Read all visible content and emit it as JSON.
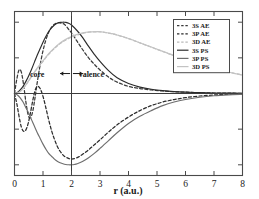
{
  "chart_data": {
    "type": "line",
    "title": "",
    "subtitle": "",
    "xlabel": "r (a.u.)",
    "ylabel": "",
    "xlim": [
      0,
      8
    ],
    "ylim": [
      -1.15,
      1.15
    ],
    "xticks": [
      0,
      1,
      2,
      3,
      4,
      5,
      6,
      7,
      8
    ],
    "xticklabels": [
      "0",
      "1",
      "2",
      "3",
      "4",
      "5",
      "6",
      "7",
      "8"
    ],
    "yticks": [
      -1.0,
      -0.5,
      0.0,
      0.5,
      1.0
    ],
    "yticklabels": [
      "",
      "",
      "",
      "",
      ""
    ],
    "grid": false,
    "legend_position": "upper right",
    "zero_line": 0,
    "annotations": [
      {
        "name": "cutoff-line",
        "type": "vline",
        "x": 2.0,
        "label": ""
      },
      {
        "name": "core-label",
        "type": "text",
        "text": "core",
        "x": 1.05,
        "y": 0.28
      },
      {
        "name": "valence-label",
        "type": "text",
        "text": "valence",
        "x": 2.25,
        "y": 0.28
      },
      {
        "name": "core-arrow",
        "type": "arrow",
        "from_x": 1.95,
        "to_x": 1.6,
        "y": 0.28
      },
      {
        "name": "valence-arrow",
        "type": "arrow",
        "from_x": 2.05,
        "to_x": 2.4,
        "y": 0.28
      }
    ],
    "series": [
      {
        "name": "3S AE",
        "style": "dashed",
        "color": "#3a3a3a",
        "x": [
          0.0,
          0.08,
          0.16,
          0.24,
          0.32,
          0.4,
          0.48,
          0.56,
          0.64,
          0.72,
          0.8,
          0.9,
          1.0,
          1.1,
          1.2,
          1.3,
          1.4,
          1.5,
          1.6,
          1.75,
          1.9,
          2.0,
          2.2,
          2.4,
          2.6,
          2.8,
          3.0,
          3.3,
          3.6,
          4.0,
          4.4,
          4.8,
          5.2,
          5.6,
          6.0,
          6.5,
          7.0,
          7.5,
          8.0
        ],
        "y": [
          0.0,
          0.2,
          0.33,
          0.3,
          0.12,
          -0.12,
          -0.3,
          -0.34,
          -0.25,
          -0.06,
          0.16,
          0.4,
          0.6,
          0.75,
          0.86,
          0.93,
          0.97,
          0.99,
          0.99,
          0.97,
          0.9,
          0.85,
          0.73,
          0.61,
          0.5,
          0.41,
          0.33,
          0.23,
          0.16,
          0.1,
          0.07,
          0.05,
          0.035,
          0.025,
          0.018,
          0.011,
          0.007,
          0.004,
          0.003
        ]
      },
      {
        "name": "3P AE",
        "style": "dashed",
        "color": "#2b2b2b",
        "x": [
          0.0,
          0.08,
          0.16,
          0.24,
          0.32,
          0.4,
          0.48,
          0.56,
          0.64,
          0.72,
          0.8,
          0.9,
          1.0,
          1.1,
          1.2,
          1.3,
          1.4,
          1.5,
          1.6,
          1.75,
          1.9,
          2.0,
          2.2,
          2.4,
          2.6,
          2.8,
          3.0,
          3.3,
          3.6,
          4.0,
          4.4,
          4.8,
          5.2,
          5.6,
          6.0,
          6.5,
          7.0,
          7.5,
          8.0
        ],
        "y": [
          0.0,
          -0.14,
          -0.32,
          -0.47,
          -0.53,
          -0.51,
          -0.42,
          -0.27,
          -0.1,
          0.04,
          0.1,
          0.07,
          -0.04,
          -0.2,
          -0.37,
          -0.52,
          -0.64,
          -0.74,
          -0.81,
          -0.88,
          -0.91,
          -0.92,
          -0.9,
          -0.85,
          -0.79,
          -0.72,
          -0.65,
          -0.54,
          -0.44,
          -0.33,
          -0.24,
          -0.17,
          -0.12,
          -0.085,
          -0.058,
          -0.035,
          -0.021,
          -0.012,
          -0.008
        ]
      },
      {
        "name": "3D AE",
        "style": "dashed",
        "color": "#b9b9b9",
        "x": [
          0.0,
          0.1,
          0.2,
          0.3,
          0.4,
          0.5,
          0.6,
          0.7,
          0.8,
          0.9,
          1.0,
          1.2,
          1.4,
          1.6,
          1.8,
          2.0,
          2.2,
          2.4,
          2.6,
          2.8,
          2.9,
          3.0,
          3.2,
          3.4,
          3.6,
          4.0,
          4.4,
          4.8,
          5.2,
          5.6,
          6.0,
          6.5,
          7.0,
          7.5,
          8.0
        ],
        "y": [
          0.0,
          0.01,
          0.03,
          0.07,
          0.12,
          0.18,
          0.24,
          0.3,
          0.35,
          0.4,
          0.45,
          0.55,
          0.63,
          0.7,
          0.75,
          0.79,
          0.82,
          0.845,
          0.86,
          0.865,
          0.866,
          0.865,
          0.855,
          0.84,
          0.82,
          0.77,
          0.71,
          0.65,
          0.59,
          0.53,
          0.48,
          0.41,
          0.35,
          0.3,
          0.26
        ]
      },
      {
        "name": "3S PS",
        "style": "solid",
        "color": "#2b2b2b",
        "x": [
          0.0,
          0.1,
          0.2,
          0.3,
          0.4,
          0.5,
          0.6,
          0.7,
          0.8,
          0.9,
          1.0,
          1.1,
          1.2,
          1.3,
          1.4,
          1.5,
          1.6,
          1.7,
          1.75,
          1.8,
          1.9,
          2.0,
          2.2,
          2.4,
          2.6,
          2.8,
          3.0,
          3.3,
          3.6,
          4.0,
          4.4,
          4.8,
          5.2,
          5.6,
          6.0,
          6.5,
          7.0,
          7.5,
          8.0
        ],
        "y": [
          0.0,
          0.015,
          0.05,
          0.1,
          0.17,
          0.25,
          0.34,
          0.44,
          0.54,
          0.63,
          0.72,
          0.8,
          0.87,
          0.92,
          0.96,
          0.985,
          0.998,
          1.0,
          1.0,
          0.998,
          0.985,
          0.96,
          0.88,
          0.78,
          0.66,
          0.55,
          0.45,
          0.32,
          0.22,
          0.14,
          0.09,
          0.06,
          0.04,
          0.027,
          0.019,
          0.012,
          0.007,
          0.005,
          0.003
        ]
      },
      {
        "name": "3P PS",
        "style": "solid",
        "color": "#6e6e6e",
        "x": [
          0.0,
          0.1,
          0.2,
          0.3,
          0.4,
          0.5,
          0.6,
          0.7,
          0.8,
          0.9,
          1.0,
          1.1,
          1.2,
          1.3,
          1.4,
          1.5,
          1.6,
          1.7,
          1.8,
          1.9,
          2.0,
          2.1,
          2.2,
          2.4,
          2.6,
          2.8,
          3.0,
          3.3,
          3.6,
          4.0,
          4.4,
          4.8,
          5.2,
          5.6,
          6.0,
          6.5,
          7.0,
          7.5,
          8.0
        ],
        "y": [
          0.0,
          -0.02,
          -0.06,
          -0.12,
          -0.2,
          -0.28,
          -0.37,
          -0.46,
          -0.55,
          -0.63,
          -0.71,
          -0.78,
          -0.84,
          -0.88,
          -0.92,
          -0.95,
          -0.97,
          -0.985,
          -0.995,
          -1.0,
          -1.0,
          -0.995,
          -0.985,
          -0.95,
          -0.9,
          -0.84,
          -0.77,
          -0.66,
          -0.55,
          -0.42,
          -0.32,
          -0.24,
          -0.17,
          -0.12,
          -0.085,
          -0.052,
          -0.031,
          -0.019,
          -0.012
        ]
      },
      {
        "name": "3D PS",
        "style": "solid",
        "color": "#c3c3c3",
        "x": [
          0.0,
          0.1,
          0.2,
          0.3,
          0.4,
          0.5,
          0.6,
          0.7,
          0.8,
          0.9,
          1.0,
          1.2,
          1.4,
          1.6,
          1.8,
          2.0,
          2.2,
          2.4,
          2.6,
          2.8,
          2.9,
          3.0,
          3.2,
          3.4,
          3.6,
          4.0,
          4.4,
          4.8,
          5.2,
          5.6,
          6.0,
          6.5,
          7.0,
          7.5,
          8.0
        ],
        "y": [
          0.0,
          0.01,
          0.03,
          0.07,
          0.12,
          0.18,
          0.24,
          0.3,
          0.36,
          0.41,
          0.46,
          0.56,
          0.64,
          0.71,
          0.76,
          0.8,
          0.83,
          0.85,
          0.862,
          0.866,
          0.867,
          0.866,
          0.856,
          0.841,
          0.821,
          0.771,
          0.711,
          0.651,
          0.591,
          0.533,
          0.479,
          0.412,
          0.351,
          0.301,
          0.259
        ]
      }
    ],
    "legend": [
      {
        "label": "3S  AE",
        "style": "dashed",
        "color": "#3a3a3a"
      },
      {
        "label": "3P  AE",
        "style": "dashed",
        "color": "#2b2b2b"
      },
      {
        "label": "3D AE",
        "style": "dashed",
        "color": "#b9b9b9"
      },
      {
        "label": "3S  PS",
        "style": "solid",
        "color": "#2b2b2b"
      },
      {
        "label": "3P  PS",
        "style": "solid",
        "color": "#6e6e6e"
      },
      {
        "label": "3D PS",
        "style": "solid",
        "color": "#c3c3c3"
      }
    ]
  }
}
